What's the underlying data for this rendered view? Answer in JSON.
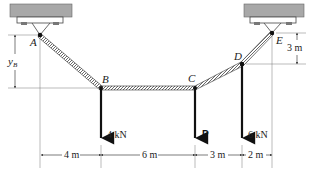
{
  "points": {
    "A": {
      "label": "A"
    },
    "B": {
      "label": "B"
    },
    "C": {
      "label": "C"
    },
    "D": {
      "label": "D"
    },
    "E": {
      "label": "E"
    }
  },
  "loads": {
    "B": "4 kN",
    "C": "P",
    "D": "6 kN"
  },
  "dimensions": {
    "horizontal": [
      "4 m",
      "6 m",
      "3 m",
      "2 m"
    ],
    "right_vertical": "3 m",
    "left_vertical_var": "y",
    "left_vertical_sub": "B"
  },
  "colors": {
    "support": "#9a9a9a",
    "cable": "#333333",
    "line": "#111111"
  }
}
